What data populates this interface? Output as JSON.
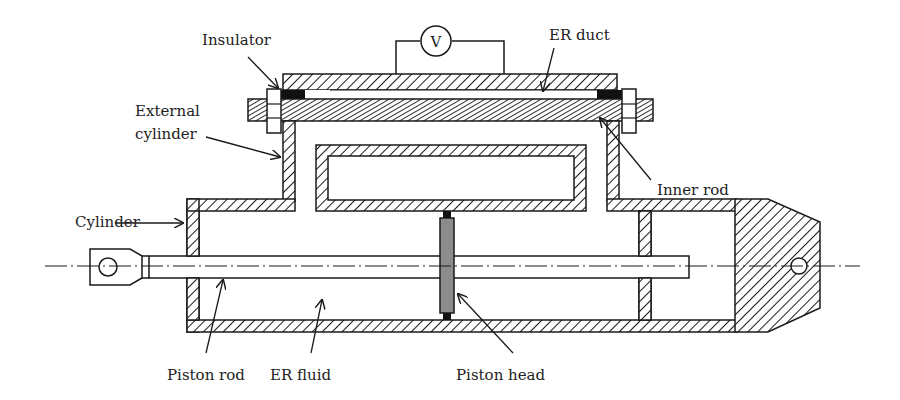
{
  "diagram": {
    "colors": {
      "line": "#1a1a1a",
      "background": "#ffffff",
      "piston_fill": "#8c8c8c",
      "insulator_fill": "#111111"
    },
    "labels": {
      "insulator": "Insulator",
      "voltmeter": "V",
      "er_duct": "ER duct",
      "external_cylinder_line1": "External",
      "external_cylinder_line2": "cylinder",
      "inner_rod": "Inner rod",
      "cylinder": "Cylinder",
      "piston_rod": "Piston rod",
      "er_fluid": "ER fluid",
      "piston_head": "Piston head"
    }
  }
}
